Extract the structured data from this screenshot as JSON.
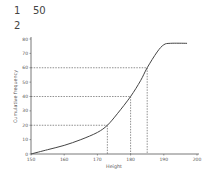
{
  "questions": [
    {
      "number": "1",
      "value": "50"
    },
    {
      "number": "2",
      "value": ""
    }
  ],
  "chart_data": {
    "type": "line",
    "title": "",
    "xlabel": "Height",
    "ylabel": "Cumulative frequency",
    "xlim": [
      150,
      200
    ],
    "ylim": [
      0,
      80
    ],
    "x_ticks": [
      150,
      160,
      170,
      180,
      190,
      200
    ],
    "y_ticks": [
      0,
      10,
      20,
      30,
      40,
      50,
      60,
      70,
      80
    ],
    "grid": false,
    "series": [
      {
        "name": "Cumulative frequency curve",
        "x": [
          150,
          155,
          160,
          165,
          170,
          173,
          176,
          180,
          183,
          185,
          188,
          190,
          192,
          197
        ],
        "y": [
          0,
          3,
          6,
          10,
          15,
          20,
          28,
          40,
          51,
          60,
          71,
          76,
          77,
          77
        ]
      }
    ],
    "reference_lines": [
      {
        "y": 20,
        "x": 173
      },
      {
        "y": 40,
        "x": 180
      },
      {
        "y": 60,
        "x": 185
      }
    ],
    "line_color": "#444444"
  }
}
